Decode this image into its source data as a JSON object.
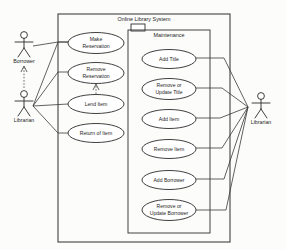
{
  "diagram": {
    "type": "uml-use-case-diagram",
    "system_boundary": {
      "title": "Online Library System",
      "x": 58,
      "y": 14,
      "width": 172,
      "height": 228
    },
    "package": {
      "title": "Maintenance",
      "x": 128,
      "y": 30,
      "width": 82,
      "height": 203,
      "tab": {
        "x": 131,
        "y": 24,
        "width": 14,
        "height": 7
      }
    },
    "actors": [
      {
        "id": "actor-borrower",
        "label": "Borrower",
        "x": 24,
        "y": 34,
        "label_x": 24,
        "label_y": 63
      },
      {
        "id": "actor-librarian-left",
        "label": "Librarian",
        "x": 24,
        "y": 93,
        "label_x": 24,
        "label_y": 122
      },
      {
        "id": "actor-librarian-right",
        "label": "Librarian",
        "x": 261,
        "y": 97,
        "label_x": 261,
        "label_y": 126
      }
    ],
    "use_cases": [
      {
        "id": "uc-make-reservation",
        "lines": [
          "Make",
          "Reservation"
        ],
        "cx": 96,
        "cy": 43,
        "rx": 28,
        "ry": 10.5,
        "group": "left"
      },
      {
        "id": "uc-remove-reservation",
        "lines": [
          "Remove",
          "Reservation"
        ],
        "cx": 96,
        "cy": 73,
        "rx": 28,
        "ry": 10.5,
        "group": "left"
      },
      {
        "id": "uc-lend-item",
        "lines": [
          "Lend Item"
        ],
        "cx": 96,
        "cy": 104,
        "rx": 28,
        "ry": 9.5,
        "group": "left"
      },
      {
        "id": "uc-return-of-item",
        "lines": [
          "Return of Item"
        ],
        "cx": 96,
        "cy": 133,
        "rx": 28,
        "ry": 9.5,
        "group": "left"
      },
      {
        "id": "uc-add-title",
        "lines": [
          "Add Title"
        ],
        "cx": 169,
        "cy": 59,
        "rx": 27,
        "ry": 9.5,
        "group": "maintenance"
      },
      {
        "id": "uc-remove-or-update-title",
        "lines": [
          "Remove or",
          "Update Title"
        ],
        "cx": 169,
        "cy": 89,
        "rx": 27,
        "ry": 10.5,
        "group": "maintenance"
      },
      {
        "id": "uc-add-item",
        "lines": [
          "Add Item"
        ],
        "cx": 169,
        "cy": 119,
        "rx": 27,
        "ry": 9.5,
        "group": "maintenance"
      },
      {
        "id": "uc-remove-item",
        "lines": [
          "Remove Item"
        ],
        "cx": 169,
        "cy": 149,
        "rx": 27,
        "ry": 9.5,
        "group": "maintenance"
      },
      {
        "id": "uc-add-borrower",
        "lines": [
          "Add Borrower"
        ],
        "cx": 169,
        "cy": 180,
        "rx": 27,
        "ry": 9.5,
        "group": "maintenance"
      },
      {
        "id": "uc-remove-or-update-borrower",
        "lines": [
          "Remove or",
          "Update Borrower"
        ],
        "cx": 169,
        "cy": 210,
        "rx": 27,
        "ry": 10.5,
        "group": "maintenance"
      }
    ],
    "associations": [
      {
        "id": "assoc-borrower-make-reservation",
        "from": "actor-borrower",
        "to": "uc-make-reservation"
      },
      {
        "id": "assoc-librarian-make-reservation",
        "from": "actor-librarian-left",
        "to": "uc-make-reservation"
      },
      {
        "id": "assoc-librarian-remove-reservation",
        "from": "actor-librarian-left",
        "to": "uc-remove-reservation"
      },
      {
        "id": "assoc-librarian-lend-item",
        "from": "actor-librarian-left",
        "to": "uc-lend-item"
      },
      {
        "id": "assoc-librarian-return-of-item",
        "from": "actor-librarian-left",
        "to": "uc-return-of-item"
      },
      {
        "id": "assoc-librarian-add-title",
        "from": "actor-librarian-right",
        "to": "uc-add-title"
      },
      {
        "id": "assoc-librarian-remove-or-update-title",
        "from": "actor-librarian-right",
        "to": "uc-remove-or-update-title"
      },
      {
        "id": "assoc-librarian-add-item",
        "from": "actor-librarian-right",
        "to": "uc-add-item"
      },
      {
        "id": "assoc-librarian-remove-item",
        "from": "actor-librarian-right",
        "to": "uc-remove-item"
      },
      {
        "id": "assoc-librarian-add-borrower",
        "from": "actor-librarian-right",
        "to": "uc-add-borrower"
      },
      {
        "id": "assoc-librarian-remove-or-update-borrower",
        "from": "actor-librarian-right",
        "to": "uc-remove-or-update-borrower"
      }
    ],
    "generalizations": [
      {
        "id": "gen-librarian-to-borrower",
        "from": "actor-librarian-left",
        "to": "actor-borrower",
        "style": "dashed"
      },
      {
        "id": "gen-lend-item-to-remove-reservation",
        "from": "uc-lend-item",
        "to": "uc-remove-reservation",
        "style": "dashed"
      }
    ],
    "colors": {
      "stroke": "#2a2a2a",
      "background": "#fcfcfb",
      "shape_fill": "#ffffff"
    }
  }
}
